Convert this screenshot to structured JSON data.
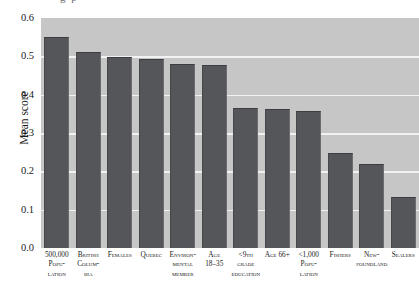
{
  "figure": {
    "title_remnant": "g  p",
    "background_plot_color": "#c6c6c6",
    "bar_color": "#55565a",
    "gridline_color": "#f2f2f2"
  },
  "chart_data": {
    "type": "bar",
    "title": "",
    "xlabel": "",
    "ylabel": "Mean score",
    "ylim": [
      0.0,
      0.6
    ],
    "yticks": [
      "0.0",
      "0.1",
      "0.2",
      "0.3",
      "0.4",
      "0.5",
      "0.6"
    ],
    "ytick_values": [
      0.0,
      0.1,
      0.2,
      0.3,
      0.4,
      0.5,
      0.6
    ],
    "grid": true,
    "gridlines_at": [
      0.1,
      0.2,
      0.3,
      0.4,
      0.5
    ],
    "legend": null,
    "categories": [
      "500,000 Popu-lation",
      "British Colum-bia",
      "Females",
      "Quebec",
      "Environ-mental member",
      "Age 18-35",
      "<9th grade education",
      "Age 66+",
      "<1,000 Popu-lation",
      "Fishers",
      "New-foundland",
      "Sealers"
    ],
    "category_lines": [
      [
        "500,000",
        "Popu-",
        "lation"
      ],
      [
        "British",
        "Colum-",
        "bia"
      ],
      [
        "Females"
      ],
      [
        "Quebec"
      ],
      [
        "Environ-",
        "mental",
        "member"
      ],
      [
        "Age",
        "18–35"
      ],
      [
        "<9th",
        "grade",
        "education"
      ],
      [
        "Age 66+"
      ],
      [
        "<1,000",
        "Popu-",
        "lation"
      ],
      [
        "Fishers"
      ],
      [
        "New-",
        "foundland"
      ],
      [
        "Sealers"
      ]
    ],
    "values": [
      0.551,
      0.512,
      0.499,
      0.494,
      0.48,
      0.478,
      0.366,
      0.363,
      0.358,
      0.248,
      0.219,
      0.133
    ]
  }
}
